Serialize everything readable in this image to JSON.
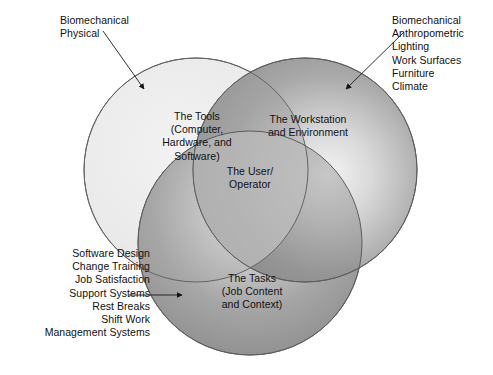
{
  "diagram": {
    "colors": {
      "tools_fill_light": "#ededed",
      "tools_fill_edge": "#dcdcdc",
      "station_fill_light": "#f2f2f2",
      "station_fill_edge": "#8f8f8f",
      "tasks_fill_light": "#f0f0f0",
      "tasks_fill_edge": "#8f8f8f",
      "stroke": "#555555",
      "text": "#111111",
      "background": "#ffffff"
    },
    "circles": [
      {
        "id": "tools",
        "name": "The Tools",
        "cx": 196,
        "cy": 170,
        "r": 112
      },
      {
        "id": "station",
        "name": "The Workstation and Environment",
        "cx": 305,
        "cy": 170,
        "r": 112
      },
      {
        "id": "tasks",
        "name": "The Tasks",
        "cx": 250,
        "cy": 243,
        "r": 112
      }
    ],
    "circle_labels": {
      "tools": "The Tools\n(Computer,\nHardware, and\nSoftware)",
      "station": "The Workstation\nand Environment",
      "user": "The User/\nOperator",
      "tasks": "The Tasks\n(Job Content\nand Context)"
    },
    "callouts": {
      "tools": {
        "items": [
          "Biomechanical",
          "Physical"
        ],
        "text": "Biomechanical\nPhysical"
      },
      "station": {
        "items": [
          "Biomechanical",
          "Anthropometric",
          "Lighting",
          "Work Surfaces",
          "Furniture",
          "Climate"
        ],
        "text": "Biomechanical\nAnthropometric\nLighting\nWork Surfaces\nFurniture\nClimate"
      },
      "tasks": {
        "items": [
          "Software Design",
          "Change Training",
          "Job Satisfaction",
          "Support Systems",
          "Rest Breaks",
          "Shift Work",
          "Management Systems"
        ],
        "text": "Software Design\nChange Training\nJob Satisfaction\nSupport Systems\nRest Breaks\nShift Work\nManagement Systems"
      }
    },
    "arrows": [
      {
        "id": "arrow-tools",
        "from_x": 103,
        "from_y": 31,
        "to_x": 146,
        "to_y": 92
      },
      {
        "id": "arrow-station",
        "from_x": 404,
        "from_y": 32,
        "to_x": 344,
        "to_y": 92
      },
      {
        "id": "arrow-tasks",
        "from_x": 129,
        "from_y": 295,
        "to_x": 184,
        "to_y": 295
      }
    ]
  }
}
